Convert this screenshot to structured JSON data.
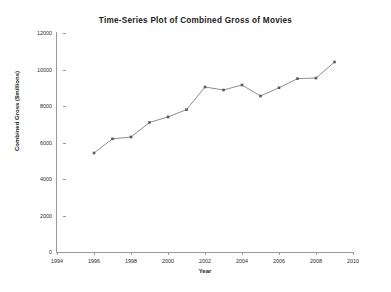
{
  "chart_data": {
    "type": "line",
    "title": "Time-Series Plot of Combined Gross of Movies",
    "xlabel": "Year",
    "ylabel": "Combined Gross ($millions)",
    "x": [
      1996,
      1997,
      1998,
      1999,
      2000,
      2001,
      2002,
      2003,
      2004,
      2005,
      2006,
      2007,
      2008,
      2009
    ],
    "values": [
      5425,
      6200,
      6300,
      7100,
      7400,
      7800,
      9041,
      8876,
      9151,
      8548,
      9000,
      9500,
      9530,
      10411
    ],
    "series": [
      {
        "name": "Combined Gross",
        "values": [
          5425,
          6200,
          6300,
          7100,
          7400,
          7800,
          9041,
          8876,
          9151,
          8548,
          9000,
          9500,
          9530,
          10411
        ]
      }
    ],
    "xlim": [
      1994,
      2010
    ],
    "ylim": [
      0,
      12000
    ],
    "x_ticks": [
      1994,
      1996,
      1998,
      2000,
      2002,
      2004,
      2006,
      2008,
      2010
    ],
    "x_tick_labels": [
      "1994",
      "1996",
      "1998",
      "2000",
      "2002",
      "2004",
      "2006",
      "2008",
      "2010"
    ],
    "y_ticks": [
      0,
      2000,
      4000,
      6000,
      8000,
      10000,
      12000
    ],
    "y_tick_labels": [
      "0",
      "2000",
      "4000",
      "6000",
      "8000",
      "10000",
      "12000"
    ],
    "grid": false,
    "legend": "none",
    "line_color": "#808080",
    "marker_color": "#595959",
    "marker_shape": "square",
    "axis_color": "#9a9a9a",
    "background_color": "#ffffff"
  }
}
